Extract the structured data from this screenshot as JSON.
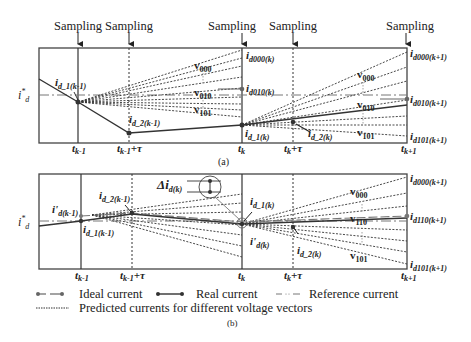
{
  "panel_a": {
    "caption": "(a)",
    "sampling_label": "Sampling",
    "reference_label": "i*d",
    "time_labels": [
      "t",
      "k-1",
      "t",
      "k-1",
      "+τ",
      "t",
      "k",
      "t",
      "k",
      "+τ",
      "t",
      "k+1"
    ],
    "ticks": {
      "t_km1": {
        "base": "t",
        "sub": "k-1"
      },
      "t_km1_tau": {
        "base": "t",
        "sub": "k-1",
        "suffix": "+τ"
      },
      "t_k": {
        "base": "t",
        "sub": "k"
      },
      "t_k_tau": {
        "base": "t",
        "sub": "k",
        "suffix": "+τ"
      },
      "t_kp1": {
        "base": "t",
        "sub": "k+1"
      }
    },
    "points": {
      "id1_km1": {
        "base": "i",
        "sub": "d_1(k-1)"
      },
      "id2_km1": {
        "base": "i",
        "sub": "d_2(k-1)"
      },
      "id000_k": {
        "base": "i",
        "sub": "d000(k)"
      },
      "id010_k": {
        "base": "i",
        "sub": "d010(k)"
      },
      "id1_k": {
        "base": "i",
        "sub": "d_1(k)"
      },
      "id2_k": {
        "base": "i",
        "sub": "d_2(k)"
      },
      "id000_kp1": {
        "base": "i",
        "sub": "d000(k+1)"
      },
      "id010_kp1": {
        "base": "i",
        "sub": "d010(k+1)"
      },
      "id101_kp1": {
        "base": "i",
        "sub": "d101(k+1)"
      }
    },
    "vectors_left": [
      {
        "base": "v",
        "sub": "000"
      },
      {
        "base": "v",
        "sub": "010"
      },
      {
        "base": "v",
        "sub": "101"
      }
    ],
    "vectors_right": [
      {
        "base": "v",
        "sub": "000"
      },
      {
        "base": "v",
        "sub": "010"
      },
      {
        "base": "v",
        "sub": "101"
      }
    ]
  },
  "panel_b": {
    "caption": "(b)",
    "delta_label": {
      "base": "Δi",
      "sub": "d(k)"
    },
    "points": {
      "ip_km1": {
        "base": "i'",
        "sub": "d(k-1)"
      },
      "id1_km1": {
        "base": "i",
        "sub": "d_1(k-1)"
      },
      "id2_km1": {
        "base": "i",
        "sub": "d_2(k-1)"
      },
      "id1_k": {
        "base": "i",
        "sub": "d_1(k)"
      },
      "ip_k": {
        "base": "i'",
        "sub": "d(k)"
      },
      "id2_k": {
        "base": "i",
        "sub": "d_2(k)"
      },
      "id000_kp1": {
        "base": "i",
        "sub": "d000(k+1)"
      },
      "id110_kp1": {
        "base": "i",
        "sub": "d110(k+1)"
      },
      "id101_kp1": {
        "base": "i",
        "sub": "d101(k+1)"
      }
    },
    "vectors_right": [
      {
        "base": "v",
        "sub": "000"
      },
      {
        "base": "v",
        "sub": "110"
      },
      {
        "base": "v",
        "sub": "101"
      }
    ]
  },
  "legend": {
    "ideal": "Ideal current",
    "real": "Real current",
    "reference": "Reference current",
    "predicted": "Predicted currents for different voltage vectors"
  },
  "colors": {
    "line": "#333333",
    "frame": "#444444",
    "reference": "#777777",
    "ideal": "#666666"
  }
}
